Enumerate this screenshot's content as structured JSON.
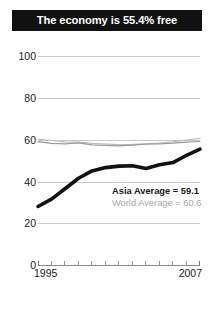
{
  "title": "The economy is 55.4% free",
  "annotations": {
    "asia": "Asia Average = 59.1",
    "world": "World Average = 60.6"
  },
  "axis": {
    "y_ticks": [
      "100",
      "80",
      "60",
      "40",
      "20",
      "0"
    ],
    "x_start_label": "1995",
    "x_end_label": "2007"
  },
  "chart_data": {
    "type": "line",
    "title": "The economy is 55.4% free",
    "xlabel": "",
    "ylabel": "",
    "ylim": [
      0,
      100
    ],
    "xlim": [
      1995,
      2007
    ],
    "grid": true,
    "legend": "inline-annotation",
    "x": [
      1995,
      1996,
      1997,
      1998,
      1999,
      2000,
      2001,
      2002,
      2003,
      2004,
      2005,
      2006,
      2007
    ],
    "series": [
      {
        "name": "Country score",
        "style": "thick-black",
        "color": "#111111",
        "values": [
          28.0,
          31.5,
          36.5,
          41.5,
          45.0,
          46.6,
          47.3,
          47.5,
          46.2,
          48.0,
          49.0,
          52.5,
          55.4
        ]
      },
      {
        "name": "Asia Average",
        "style": "thin-gray",
        "color": "#9a9a9a",
        "final_value": 59.1,
        "values": [
          59.0,
          58.2,
          58.0,
          58.4,
          57.5,
          57.2,
          57.0,
          57.4,
          57.8,
          58.0,
          58.3,
          58.8,
          59.1
        ]
      },
      {
        "name": "World Average",
        "style": "thin-gray-light",
        "color": "#bdbdbd",
        "final_value": 60.6,
        "values": [
          60.1,
          59.6,
          58.9,
          58.8,
          58.2,
          57.9,
          57.6,
          57.7,
          58.0,
          58.4,
          58.9,
          59.8,
          60.6
        ]
      }
    ],
    "y_ticks": [
      0,
      20,
      40,
      60,
      80,
      100
    ],
    "x_tick_count": 13
  }
}
